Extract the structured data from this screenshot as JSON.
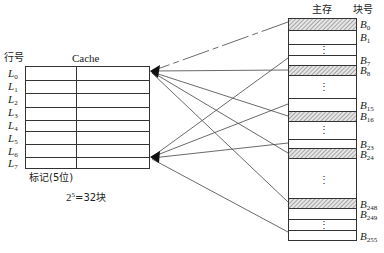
{
  "cache": {
    "row_header": "行号",
    "title": "Cache",
    "rows": [
      "L",
      "L",
      "L",
      "L",
      "L",
      "L",
      "L",
      "L"
    ],
    "row_subs": [
      "0",
      "1",
      "2",
      "3",
      "4",
      "5",
      "6",
      "7"
    ],
    "tag_label": "标记(5位)",
    "block_count_base": "2",
    "block_count_exp": "5",
    "block_count_rest": "=32块"
  },
  "memory": {
    "title": "主存",
    "block_header": "块号",
    "blocks": [
      {
        "name": "B",
        "sub": "0",
        "hatched": true
      },
      {
        "name": "B",
        "sub": "1",
        "hatched": false
      },
      {
        "name": "B",
        "sub": "7",
        "hatched": false
      },
      {
        "name": "B",
        "sub": "8",
        "hatched": true
      },
      {
        "name": "B",
        "sub": "15",
        "hatched": false
      },
      {
        "name": "B",
        "sub": "16",
        "hatched": true
      },
      {
        "name": "B",
        "sub": "23",
        "hatched": false
      },
      {
        "name": "B",
        "sub": "24",
        "hatched": true
      },
      {
        "name": "B",
        "sub": "248",
        "hatched": true
      },
      {
        "name": "B",
        "sub": "249",
        "hatched": false
      },
      {
        "name": "B",
        "sub": "255",
        "hatched": false
      }
    ],
    "ellipsis": "⋮"
  },
  "colors": {
    "line": "#333333",
    "hatch": "#8a8a8a"
  }
}
